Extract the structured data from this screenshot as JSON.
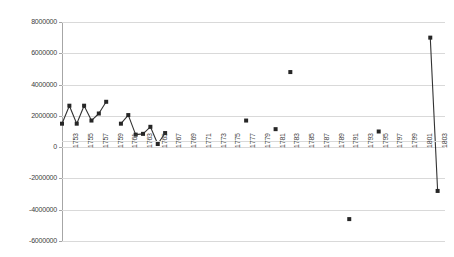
{
  "chart_data": {
    "type": "line",
    "title": "",
    "subtitle": "",
    "xlabel": "",
    "ylabel": "",
    "grid": true,
    "legend": "none",
    "ylim": [
      -6000000,
      8000000
    ],
    "ytick_step": 2000000,
    "ytick_labels": [
      "8000000",
      "6000000",
      "4000000",
      "2000000",
      "0",
      "-2000000",
      "-4000000",
      "-6000000"
    ],
    "ytick_values": [
      8000000,
      6000000,
      4000000,
      2000000,
      0,
      -2000000,
      -4000000,
      -6000000
    ],
    "xlim": [
      1752,
      1804
    ],
    "xtick_labels": [
      "1753",
      "1755",
      "1757",
      "1759",
      "1761",
      "1763",
      "1765",
      "1767",
      "1769",
      "1771",
      "1773",
      "1775",
      "1777",
      "1779",
      "1781",
      "1783",
      "1785",
      "1787",
      "1789",
      "1791",
      "1793",
      "1795",
      "1797",
      "1799",
      "1801",
      "1803"
    ],
    "xtick_values": [
      1753,
      1755,
      1757,
      1759,
      1761,
      1763,
      1765,
      1767,
      1769,
      1771,
      1773,
      1775,
      1777,
      1779,
      1781,
      1783,
      1785,
      1787,
      1789,
      1791,
      1793,
      1795,
      1797,
      1799,
      1801,
      1803
    ],
    "xtick_rotation": -90,
    "series": [
      {
        "name": "Series 1",
        "marker": "square",
        "color": "#262626",
        "segments": [
          {
            "x": [
              1752,
              1753,
              1754,
              1755,
              1756,
              1757,
              1758
            ],
            "y": [
              1500000,
              2650000,
              1500000,
              2650000,
              1700000,
              2150000,
              2900000
            ]
          },
          {
            "x": [
              1760,
              1761,
              1762,
              1763,
              1764,
              1765,
              1766
            ],
            "y": [
              1500000,
              2050000,
              800000,
              850000,
              1300000,
              200000,
              900000
            ]
          },
          {
            "x": [
              1777
            ],
            "y": [
              1700000
            ]
          },
          {
            "x": [
              1781
            ],
            "y": [
              1150000
            ]
          },
          {
            "x": [
              1783
            ],
            "y": [
              4800000
            ]
          },
          {
            "x": [
              1791
            ],
            "y": [
              -4600000
            ]
          },
          {
            "x": [
              1795
            ],
            "y": [
              1000000
            ]
          },
          {
            "x": [
              1802,
              1803
            ],
            "y": [
              7000000,
              -2800000
            ]
          }
        ]
      }
    ]
  }
}
